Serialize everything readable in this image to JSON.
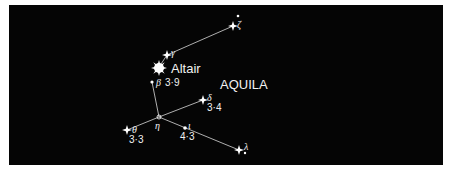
{
  "diagram": {
    "constellation_name": "AQUILA",
    "background_color": "#050505",
    "line_color": "#d9d9d9",
    "star_color": "#ffffff",
    "stars": [
      {
        "id": "zeta",
        "greek": "ζ",
        "magnitude": ""
      },
      {
        "id": "gamma",
        "greek": "γ",
        "magnitude": ""
      },
      {
        "id": "altair",
        "name": "Altair",
        "magnitude": ""
      },
      {
        "id": "beta",
        "greek": "β",
        "magnitude": "3·9"
      },
      {
        "id": "delta",
        "greek": "δ",
        "magnitude": "3·4"
      },
      {
        "id": "eta",
        "greek": "η",
        "magnitude": ""
      },
      {
        "id": "theta",
        "greek": "θ",
        "magnitude": "3·3"
      },
      {
        "id": "iota",
        "greek": "ι",
        "magnitude": "4·3"
      },
      {
        "id": "lambda",
        "greek": "λ",
        "magnitude": ""
      }
    ]
  }
}
